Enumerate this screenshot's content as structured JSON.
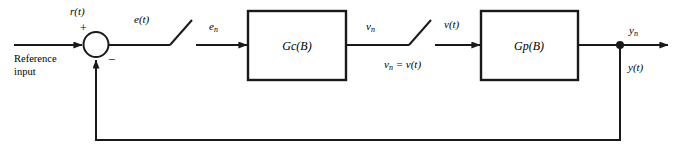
{
  "diagram": {
    "stroke_color": "#1a1a1a",
    "background_color": "#ffffff",
    "blocks": [
      {
        "name": "controller",
        "label_main": "G",
        "label_sub": "c",
        "label_tail": "(B)"
      },
      {
        "name": "plant",
        "label_main": "G",
        "label_sub": "p",
        "label_tail": "(B)"
      }
    ],
    "labels": {
      "reference_signal": {
        "main": "r",
        "tail": "(t)"
      },
      "reference_input_line1": "Reference",
      "reference_input_line2": "input",
      "plus_sign": "+",
      "minus_sign": "−",
      "error_continuous": {
        "main": "e",
        "tail": "(t)"
      },
      "error_sampled": {
        "main": "e",
        "sub": "n"
      },
      "control_sampled": {
        "main": "v",
        "sub": "n"
      },
      "sampler_equality": {
        "main": "v",
        "sub": "n",
        "tail": " = v(t)"
      },
      "control_continuous": {
        "main": "v",
        "tail": "(t)"
      },
      "output_sampled": {
        "main": "y",
        "sub": "n"
      },
      "output_continuous": {
        "main": "y",
        "tail": "(t)"
      }
    },
    "elements": {
      "summing_junction": "summing-junction",
      "sampler_1": "sampler-switch-error",
      "sampler_2": "sampler-switch-control",
      "branch_point": "output-branch-point",
      "feedback_path": "feedback-path"
    }
  }
}
